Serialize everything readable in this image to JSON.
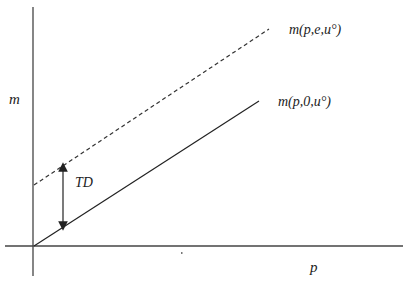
{
  "diagram": {
    "type": "economics-expenditure-function",
    "axes": {
      "y_label": "m",
      "x_label": "p"
    },
    "lines": [
      {
        "id": "with-externality",
        "label": "m(p,e,u°)",
        "style": "dashed",
        "color": "#333333"
      },
      {
        "id": "baseline",
        "label": "m(p,0,u°)",
        "style": "solid",
        "color": "#222222"
      }
    ],
    "annotation": {
      "label": "TD",
      "description": "double-headed vertical arrow between the two lines"
    }
  }
}
